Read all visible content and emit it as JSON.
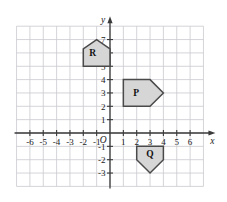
{
  "figure": {
    "background_color": "#ffffff",
    "grid_color": "#c9c9cf",
    "axis_color": "#3a3a3a",
    "shape_fill": "#d6d6d6",
    "shape_stroke": "#4a4a4a"
  },
  "chart_data": {
    "type": "scatter",
    "title": "",
    "xlabel": "x",
    "ylabel": "y",
    "xlim": [
      -7,
      7
    ],
    "ylim": [
      -4,
      8
    ],
    "grid": true,
    "legend": "none",
    "x_tick_labels": [
      "-6",
      "-5",
      "-4",
      "-3",
      "-2",
      "-1",
      "1",
      "2",
      "3",
      "4",
      "5",
      "6"
    ],
    "x_tick_values": [
      -6,
      -5,
      -4,
      -3,
      -2,
      -1,
      1,
      2,
      3,
      4,
      5,
      6
    ],
    "y_tick_labels": [
      "7",
      "6",
      "5",
      "4",
      "3",
      "2",
      "1",
      "-1",
      "-2",
      "-3"
    ],
    "y_tick_values": [
      7,
      6,
      5,
      4,
      3,
      2,
      1,
      -1,
      -2,
      -3
    ],
    "origin_label": "O",
    "shapes": [
      {
        "label": "R",
        "name": "pentagon-r",
        "orientation": "up",
        "label_point": [
          -1.3,
          6
        ],
        "vertices": [
          [
            -2,
            5
          ],
          [
            -2,
            6.3
          ],
          [
            -1,
            7
          ],
          [
            0,
            6.3
          ],
          [
            0,
            5
          ]
        ]
      },
      {
        "label": "P",
        "name": "pentagon-p",
        "orientation": "right",
        "label_point": [
          1.95,
          3
        ],
        "vertices": [
          [
            1,
            2
          ],
          [
            1,
            4
          ],
          [
            3,
            4
          ],
          [
            4,
            3
          ],
          [
            3,
            2
          ]
        ]
      },
      {
        "label": "Q",
        "name": "pentagon-q",
        "orientation": "down",
        "label_point": [
          3,
          -1.55
        ],
        "vertices": [
          [
            2,
            -1
          ],
          [
            4,
            -1
          ],
          [
            4,
            -2
          ],
          [
            3,
            -3
          ],
          [
            2,
            -2
          ]
        ]
      }
    ]
  }
}
